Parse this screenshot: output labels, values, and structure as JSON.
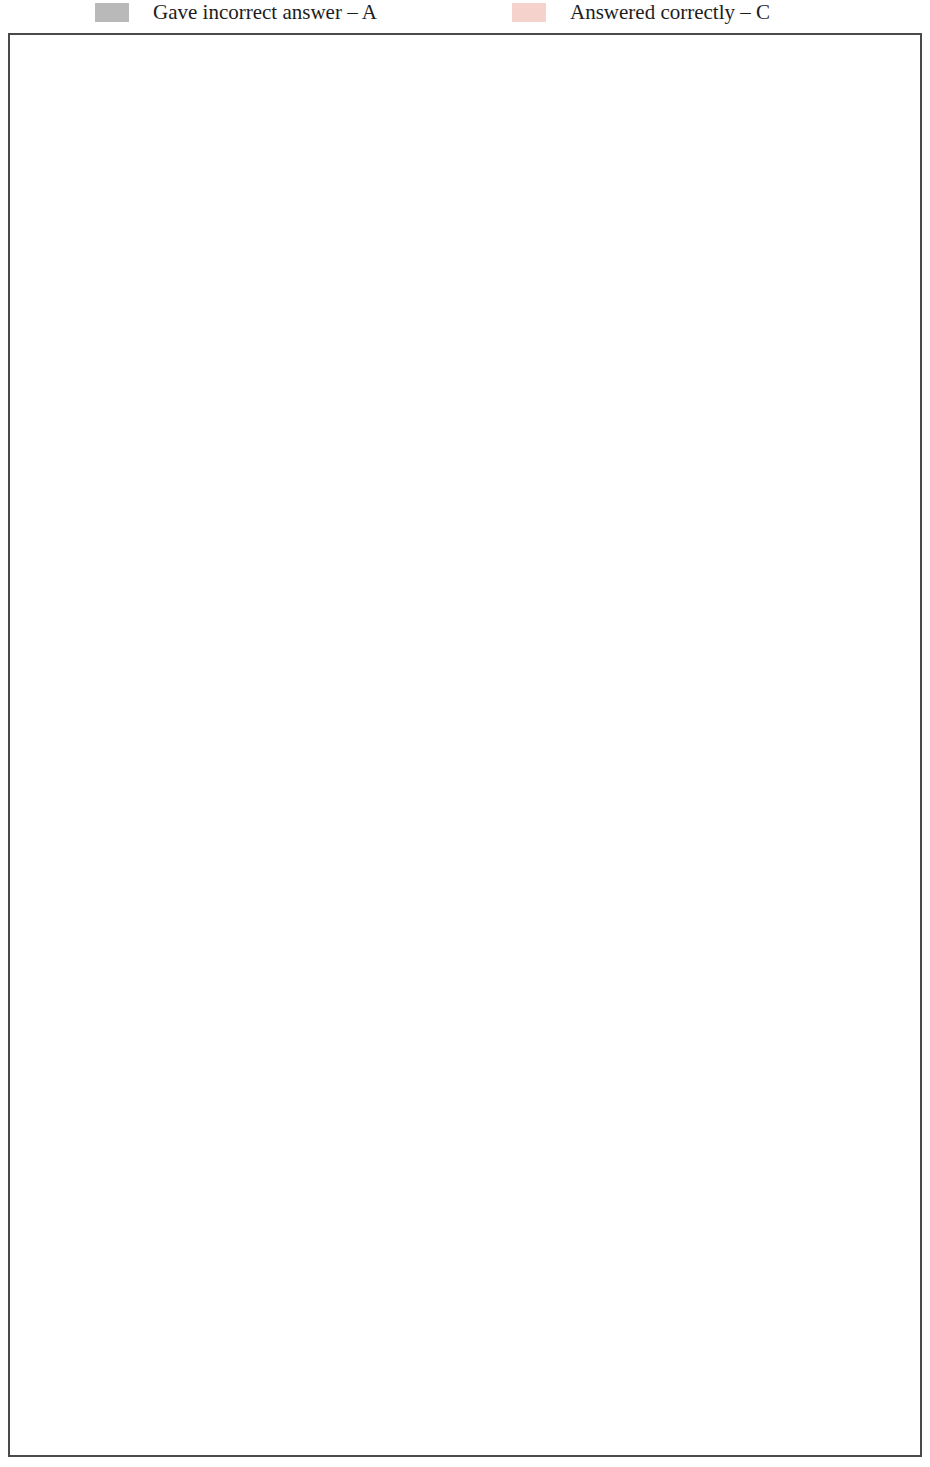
{
  "legend": {
    "incorrect": {
      "label": "Gave incorrect answer – A",
      "color": "#b9b9b9",
      "icon": "legend-swatch-gray"
    },
    "correct": {
      "label": "Answered correctly – C",
      "color": "#f6d2cd",
      "icon": "legend-swatch-pink"
    }
  },
  "axis": {
    "ticks": [
      -100,
      -80,
      -60,
      -40,
      -20,
      0,
      20,
      40,
      60,
      80,
      100
    ],
    "tick_labels": [
      "-100",
      "-80",
      "-60",
      "-40",
      "-20",
      "0",
      "20",
      "40",
      "60",
      "80",
      "100"
    ],
    "min": -100,
    "max": 100,
    "solid_gridlines": [
      -100,
      -80,
      -60,
      -40,
      0,
      60,
      80,
      100
    ],
    "dashed_gridlines": [
      -20,
      20,
      40
    ]
  },
  "colors": {
    "seg_darkest": "#2b2927",
    "seg_dark": "#6e6e6e",
    "seg_light": "#d6d6d6",
    "seg_brick": "#b2564a",
    "seg_brick_light": "#d08a7e",
    "seg_pink": "#f8d5d0",
    "oecd_text": "#c08a84",
    "partner_text": "#2a2a2a",
    "frame": "#4a4a4a",
    "gridline": "#5a5a5a"
  },
  "highlight": {
    "row": "OECD average",
    "label": "OECD average"
  },
  "chart_data": {
    "type": "bar",
    "title": "",
    "subtitle": "",
    "xlabel": "",
    "ylabel": "",
    "xlim": [
      -100,
      100
    ],
    "grid": true,
    "legend_position": "top",
    "orientation": "horizontal-diverging-stacked",
    "categories": [
      "Japan",
      "Korea",
      "Finland",
      "New Zealand",
      "Hong Kong-China",
      "Canada",
      "Australia",
      "United States",
      "Liechtenstein",
      "Iceland",
      "Macao-China",
      "Ireland",
      "United Kingdom",
      "France",
      "Sweden",
      "Belgium",
      "Greece",
      "Netherlands",
      "OECD average",
      "Denmark",
      "Italy",
      "Switzerland",
      "Norway",
      "Hungary",
      "Luxembourg",
      "Turkey",
      "Russian Federation",
      "Portugal",
      "Spain",
      "Germany",
      "Latvia",
      "Poland",
      "Czech Republic",
      "Thailand",
      "Austria",
      "Uruguay",
      "Slovak Republic",
      "Mexico",
      "Indonesia",
      "Brazil",
      "Serbia",
      "Tunisia"
    ],
    "category_types": [
      "oecd",
      "oecd",
      "oecd",
      "oecd",
      "partner",
      "oecd",
      "oecd",
      "oecd",
      "partner",
      "oecd",
      "partner",
      "oecd",
      "oecd",
      "oecd",
      "oecd",
      "oecd",
      "oecd",
      "oecd",
      "average",
      "oecd",
      "oecd",
      "oecd",
      "oecd",
      "oecd",
      "oecd",
      "oecd",
      "partner",
      "oecd",
      "oecd",
      "oecd",
      "partner",
      "oecd",
      "oecd",
      "partner",
      "oecd",
      "partner",
      "oecd",
      "oecd",
      "partner",
      "partner",
      "partner",
      "partner"
    ],
    "series": [
      {
        "name": "Gave incorrect answer – A (darkest)",
        "color": "#2b2927",
        "side": "negative",
        "values": [
          -10,
          -10,
          -13,
          -12,
          -15,
          -12,
          -12,
          -13,
          -15,
          -13,
          -13,
          -13,
          -14,
          -16,
          -13,
          -15,
          -17,
          -18,
          -16,
          -14,
          -21,
          -19,
          -17,
          -17,
          -17,
          -20,
          -26,
          -21,
          -22,
          -21,
          -24,
          -21,
          -20,
          -25,
          -20,
          -31,
          -24,
          -32,
          -30,
          -35,
          -30,
          -37
        ]
      },
      {
        "name": "Gave incorrect answer – A (dark)",
        "color": "#6e6e6e",
        "side": "negative",
        "values": [
          -8,
          -6,
          -9,
          -9,
          -8,
          -9,
          -8,
          -8,
          -7,
          -9,
          -8,
          -8,
          -8,
          -9,
          -8,
          -8,
          -9,
          -9,
          -8,
          -8,
          -7,
          -8,
          -8,
          -9,
          -9,
          -7,
          -7,
          -8,
          -8,
          -8,
          -9,
          -9,
          -9,
          -6,
          -9,
          -5,
          -9,
          -5,
          -7,
          -6,
          -8,
          -6
        ]
      },
      {
        "name": "Gave incorrect answer – A (light)",
        "color": "#d6d6d6",
        "side": "negative",
        "values": [
          -6,
          -8,
          -6,
          -9,
          -5,
          -6,
          -6,
          -6,
          -9,
          -5,
          -7,
          -6,
          -6,
          -8,
          -6,
          -6,
          -5,
          -5,
          -6,
          -6,
          -5,
          -5,
          -5,
          -6,
          -6,
          -4,
          -2,
          -5,
          -5,
          -5,
          -4,
          -5,
          -5,
          -3,
          -5,
          -3,
          -4,
          -2,
          -4,
          -3,
          -3,
          -2
        ]
      },
      {
        "name": "Gave incorrect answer – A (brick)",
        "color": "#b2564a",
        "side": "negative",
        "values": [
          -3,
          -3,
          -2,
          -1,
          -4,
          -3,
          -4,
          -3,
          -1,
          -5,
          -4,
          -4,
          -3,
          -5,
          -5,
          -4,
          -4,
          -4,
          -5,
          -5,
          -6,
          -4,
          -6,
          -4,
          -4,
          -6,
          -8,
          -5,
          -4,
          -6,
          -6,
          -6,
          -5,
          -10,
          -5,
          -14,
          -6,
          -14,
          -7,
          -16,
          -10,
          -18
        ]
      },
      {
        "name": "Answered correctly – C",
        "color": "#f8d5d0",
        "side": "positive",
        "values": [
          66,
          63,
          58,
          58,
          55,
          54,
          53,
          52,
          51,
          51,
          51,
          50,
          50,
          50,
          49,
          49,
          48,
          48,
          47,
          46,
          45,
          45,
          45,
          44,
          43,
          41,
          40,
          39,
          39,
          39,
          38,
          37,
          36,
          35,
          34,
          32,
          30,
          28,
          28,
          25,
          24,
          20
        ]
      }
    ],
    "values_note": "Diverging stacked: negative segments extend left of zero, positive (pink) extends right."
  }
}
